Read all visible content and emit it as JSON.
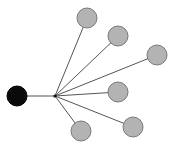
{
  "diagram": {
    "type": "star-graph",
    "width": 175,
    "height": 149,
    "colors": {
      "background": "#ffffff",
      "edge": "#555555",
      "root_fill": "#0a0a0a",
      "root_stroke": "#000000",
      "leaf_fill": "#b3b3b3",
      "leaf_stroke": "#7a7a7a",
      "hub": "#111111"
    },
    "root": {
      "id": "root",
      "cx": 17,
      "cy": 96,
      "r": 10
    },
    "hub": {
      "id": "hub",
      "cx": 55,
      "cy": 96
    },
    "leaves": [
      {
        "id": "leaf-1",
        "cx": 87,
        "cy": 18,
        "r": 10
      },
      {
        "id": "leaf-2",
        "cx": 118,
        "cy": 36,
        "r": 10
      },
      {
        "id": "leaf-3",
        "cx": 157,
        "cy": 55,
        "r": 10
      },
      {
        "id": "leaf-4",
        "cx": 118,
        "cy": 92,
        "r": 10
      },
      {
        "id": "leaf-5",
        "cx": 133,
        "cy": 127,
        "r": 10
      },
      {
        "id": "leaf-6",
        "cx": 81,
        "cy": 131,
        "r": 10
      }
    ]
  }
}
